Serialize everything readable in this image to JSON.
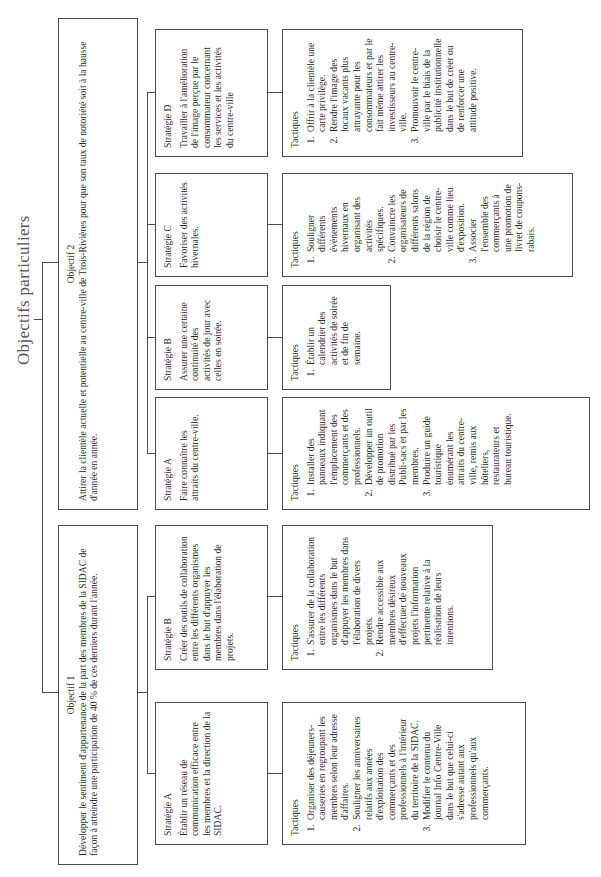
{
  "title": "Objectifs particuliers",
  "colors": {
    "line": "#4a4a4a",
    "text": "#2a2a2a",
    "background": "#ffffff"
  },
  "objectives": [
    {
      "label": "Objectif 1",
      "text": "Développer le sentiment d'appartenance de la part des membres de la SIDAC de façon à atteindre une participation de 40 % de ces derniers durant l'année.",
      "strategies": [
        {
          "label": "Stratégie A",
          "text": "Établir un réseau de communication efficace entre les membres et la direction de la SIDAC.",
          "tactics_label": "Tactiques",
          "tactics": [
            "Organiser des déjeuners-causeries en regroupant les membres selon leur adresse d'affaires.",
            "Souligner les anniversaires relatifs aux années d'exploitation des commerçants et des professionnels à l'intérieur du territoire de la SIDAC.",
            "Modifier le contenu du journal Info Centre-Ville dans le but que celui-ci s'adresse autant aux professionnels qu'aux commerçants."
          ]
        },
        {
          "label": "Stratégie B",
          "text": "Créer des outils de collaboration entre les différents organismes dans le but d'appuyer les membres dans l'élaboration de projets.",
          "tactics_label": "Tactiques",
          "tactics": [
            "S'assurer de la collaboration entre les différents organismes dans le but d'appuyer les membres dans l'élaboration de divers projets.",
            "Rendre accessible aux membres désireux d'effectuer de nouveaux projets l'information pertinente relative à la réalisation de leurs intentions."
          ]
        }
      ]
    },
    {
      "label": "Objectif 2",
      "text": "Attirer la clientèle actuelle et potentielle au centre-ville de Trois-Rivières pour que son taux de notoriété soit à la hausse d'année en année.",
      "strategies": [
        {
          "label": "Stratégie A",
          "text": "Faire connaître les attraits du centre-ville.",
          "tactics_label": "Tactiques",
          "tactics": [
            "Installer des panneaux indiquant l'emplacement des commerçants et des professionnels.",
            "Développer un outil de promotion distribué par les Publi-sacs et par les membres.",
            "Produire un guide touristique énumérant les attraits du centre-ville, remis aux hôteliers, restaurateurs et bureau touristique."
          ]
        },
        {
          "label": "Stratégie B",
          "text": "Assurer une certaine continuité des activités de jour avec celles en soirée.",
          "tactics_label": "Tactiques",
          "tactics": [
            "Établir un calendrier des activités de soirée et de fin de semaine."
          ]
        },
        {
          "label": "Stratégie C",
          "text": "Favoriser des activités hivernales.",
          "tactics_label": "Tactiques",
          "tactics": [
            "Souligner différents événements hivernaux en organisant des activités spécifiques.",
            "Convaincre les organisateurs de différents salons de la région de choisir le centre-ville comme lieu d'exposition.",
            "Associer l'ensemble des commerçants à une promotion de livret de coupons-rabais."
          ]
        },
        {
          "label": "Stratégie D",
          "text": "Travailler à l'amélioration de l'image perçue par le consommateur concernant les services et les activités du centre-ville",
          "tactics_label": "Tactiques",
          "tactics": [
            "Offrir à la clientèle une carte privilège.",
            "Rendre l'image des locaux vacants plus attrayante pour les consommateurs et par le fait même attirer les investisseurs au centre-ville.",
            "Promouvoir le centre-ville par le biais de la publicité institutionnelle dans le but de créer ou de renforcer une attitude positive."
          ]
        }
      ]
    }
  ]
}
